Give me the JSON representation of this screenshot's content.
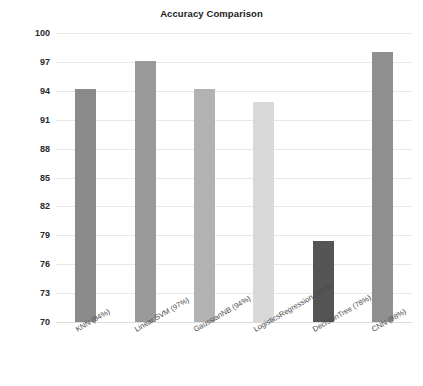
{
  "chart_data": {
    "type": "bar",
    "title": "Accuracy Comparison",
    "xlabel": "",
    "ylabel": "",
    "ylim": [
      70,
      100
    ],
    "ytick_step": 3,
    "yticks": [
      100,
      97,
      94,
      91,
      88,
      85,
      82,
      79,
      76,
      73,
      70
    ],
    "grid": true,
    "legend": "none",
    "categories": [
      "KNN (94%)",
      "Linear SVM (97%)",
      "GaussianNB (94%)",
      "LogisticsRegression (92%)",
      "DecisionTree (78%)",
      "CNN (98%)"
    ],
    "values": [
      94.2,
      97.1,
      94.2,
      92.8,
      78.4,
      98.0
    ],
    "bar_colors": [
      "#8a8a8a",
      "#9a9a9a",
      "#b2b2b2",
      "#d9d9d9",
      "#555555",
      "#8f8f8f"
    ]
  },
  "axis": {
    "gridline_color": "#e8e8e8",
    "baseline_color": "#dcdcdc"
  }
}
